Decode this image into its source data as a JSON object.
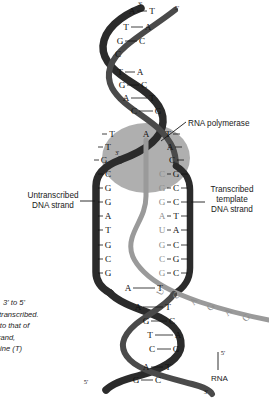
{
  "figure": {
    "labels": {
      "rna_polymerase": "RNA polymerase",
      "untranscribed_strand": "Untranscribed\nDNA strand",
      "untranscribed_line1": "Untranscribed",
      "untranscribed_line2": "DNA strand",
      "transcribed_line1": "Transcribed",
      "transcribed_line2": "template",
      "transcribed_line3": "DNA strand",
      "rna": "RNA"
    },
    "caption_lines": [
      "3' to 5'",
      "transcribed.",
      "l to that of",
      "strand,",
      "ymine (T)"
    ],
    "end_markers": {
      "top_left_strand": "3'",
      "top_right_strand": "5'",
      "bubble_template_3prime": "3'",
      "bottom_left_strand": "5'",
      "bottom_right_strand": "3'",
      "rna_5prime": "5'"
    },
    "colors": {
      "dna_dark_strand": "#2b2b2b",
      "dna_mid_strand": "#4a4a4a",
      "rna_strand": "#9a9a9a",
      "polymerase_bubble": "#9e9e9e",
      "base_letter": "#111111",
      "rna_letter": "#8d8d8d",
      "background": "#ffffff",
      "leader_line": "#1a1a1a"
    },
    "helix_top_pairs": [
      {
        "left": "A",
        "right": "T",
        "y": 14
      },
      {
        "left": "T",
        "right": "A",
        "y": 30
      },
      {
        "left": "G",
        "right": "C",
        "y": 44
      },
      {
        "left": "C",
        "right": "",
        "y": 57
      },
      {
        "left": "T",
        "right": "A",
        "y": 75
      },
      {
        "left": "G",
        "right": "C",
        "y": 88
      },
      {
        "left": "A",
        "right": "T",
        "y": 101
      },
      {
        "left": "C",
        "right": "G",
        "y": 114
      }
    ],
    "bubble_pairs": [
      {
        "left": "T",
        "mid": "A",
        "right": "T",
        "y": 137
      },
      {
        "left": "T",
        "rna": "",
        "right": "A",
        "y": 150
      },
      {
        "left": "G",
        "rna": "",
        "right": "C",
        "y": 163
      },
      {
        "left": "C",
        "rna": "C",
        "right": "G",
        "y": 177
      },
      {
        "left": "G",
        "rna": "G",
        "right": "C",
        "y": 191
      },
      {
        "left": "G",
        "rna": "G",
        "right": "C",
        "y": 205
      },
      {
        "left": "A",
        "rna": "A",
        "right": "T",
        "y": 219
      },
      {
        "left": "T",
        "rna": "U",
        "right": "A",
        "y": 233
      },
      {
        "left": "G",
        "rna": "G",
        "right": "C",
        "y": 248
      },
      {
        "left": "C",
        "rna": "C",
        "right": "G",
        "y": 262
      },
      {
        "left": "G",
        "rna": "G",
        "right": "C",
        "y": 276
      }
    ],
    "helix_bottom_pairs": [
      {
        "left": "A",
        "right": "T",
        "y": 291
      },
      {
        "left": "A",
        "right": "T",
        "y": 310
      },
      {
        "left": "G",
        "right": "C",
        "y": 324
      },
      {
        "left": "T",
        "right": "A",
        "y": 338
      },
      {
        "left": "C",
        "right": "G",
        "y": 352
      },
      {
        "left": "A",
        "right": "T",
        "y": 370
      },
      {
        "left": "G",
        "right": "C",
        "y": 383
      }
    ],
    "rna_sequence": [
      "U",
      "C",
      "A",
      "G",
      "A",
      "G"
    ]
  }
}
